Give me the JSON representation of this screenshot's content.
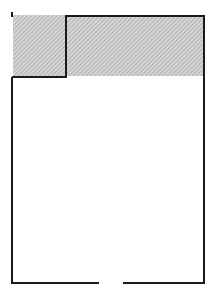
{
  "diagram": {
    "type": "floor-plan",
    "width": 215,
    "height": 297,
    "colors": {
      "wall": "#1a1a1a",
      "hatch_bg": "#d6d6d6",
      "hatch_line": "#9a9a9a",
      "background": "#ffffff"
    },
    "hatched_region": {
      "x": 13,
      "y": 15,
      "width": 191,
      "height": 61
    },
    "walls": {
      "outline_points": "12,16 12,77 66,77 66,16 204,16 204,283 123,283",
      "bottom_left_segment": "12,77 12,283 99,283"
    },
    "door_gap": {
      "x1": 99,
      "x2": 123,
      "y": 283
    },
    "marker": {
      "x": 12,
      "y": 12,
      "height": 5
    }
  }
}
